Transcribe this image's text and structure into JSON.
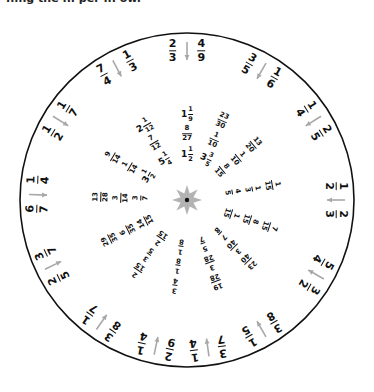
{
  "header": {
    "clipped_text": "...ng the ... per ... ow."
  },
  "colors": {
    "circle_stroke": "#111111",
    "arrow": "#a8a8a8",
    "star": "#b3b3b3",
    "center_dot": "#111111",
    "text": "#111111"
  },
  "center": {
    "x": 187,
    "y": 200,
    "radius": 167
  },
  "outer_pairs": [
    {
      "angle": 0,
      "a": "2/3",
      "b": "4/9"
    },
    {
      "angle": 30,
      "a": "3/5",
      "b": "1/6"
    },
    {
      "angle": 58,
      "a": "1/4",
      "b": "2/5"
    },
    {
      "angle": 90,
      "a": "1/2",
      "b": "2/3"
    },
    {
      "angle": 120,
      "a": "5/4",
      "b": "3/2"
    },
    {
      "angle": 150,
      "a": "3/8",
      "b": "1/5"
    },
    {
      "angle": 172,
      "a": "3/7",
      "b": "1/4"
    },
    {
      "angle": 192,
      "a": "2/9",
      "b": "1/4"
    },
    {
      "angle": 215,
      "a": "3/8",
      "b": "1/7"
    },
    {
      "angle": 244,
      "a": "2/5",
      "b": "3/7"
    },
    {
      "angle": 272,
      "a": "6/7",
      "b": "1/4"
    },
    {
      "angle": 302,
      "a": "1/2",
      "b": "1/7"
    },
    {
      "angle": 332,
      "a": "7/4",
      "b": "1/3"
    }
  ],
  "inner_spokes": [
    {
      "angle": 0,
      "values": [
        "1 1/2",
        "8/27",
        "1 1/9"
      ]
    },
    {
      "angle": 24,
      "values": [
        "3 3/5",
        "1/10",
        "23/30"
      ]
    },
    {
      "angle": 50,
      "values": [
        "8/15",
        "1/10",
        "13/20"
      ]
    },
    {
      "angle": 80,
      "values": [
        "4/5",
        "1/3",
        "1/15"
      ]
    },
    {
      "angle": 108,
      "values": [
        "1/15",
        "8/15",
        "7/15"
      ]
    },
    {
      "angle": 135,
      "values": [
        "7/8",
        "3/40",
        "23/40"
      ]
    },
    {
      "angle": 160,
      "values": [
        "5/7",
        "3/28",
        "19/28"
      ]
    },
    {
      "angle": 188,
      "values": [
        "1/8",
        "1/8",
        "3/4"
      ]
    },
    {
      "angle": 215,
      "values": [
        "2/15",
        "3/5",
        "2/15"
      ]
    },
    {
      "angle": 243,
      "values": [
        "14/15",
        "6/35",
        "29/35"
      ]
    },
    {
      "angle": 272,
      "values": [
        "3/7",
        "3/14",
        "13/28"
      ]
    },
    {
      "angle": 300,
      "values": [
        "3 1/2",
        "1/14",
        "9/14"
      ]
    },
    {
      "angle": 330,
      "values": [
        "5 1/4",
        "7/12",
        "2 1/12"
      ]
    }
  ]
}
